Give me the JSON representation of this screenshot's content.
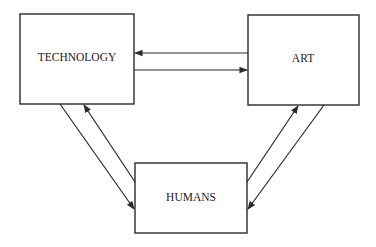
{
  "diagram": {
    "type": "block-diagram",
    "nodes": [
      {
        "id": "technology",
        "label": "TECHNOLOGY"
      },
      {
        "id": "art",
        "label": "ART"
      },
      {
        "id": "humans",
        "label": "HUMANS"
      }
    ],
    "edges": [
      {
        "from": "art",
        "to": "technology"
      },
      {
        "from": "technology",
        "to": "art"
      },
      {
        "from": "technology",
        "to": "humans"
      },
      {
        "from": "humans",
        "to": "technology"
      },
      {
        "from": "humans",
        "to": "art"
      },
      {
        "from": "art",
        "to": "humans"
      }
    ],
    "colors": {
      "stroke": "#2a2a2a",
      "text": "#222222",
      "background": "#ffffff"
    }
  }
}
